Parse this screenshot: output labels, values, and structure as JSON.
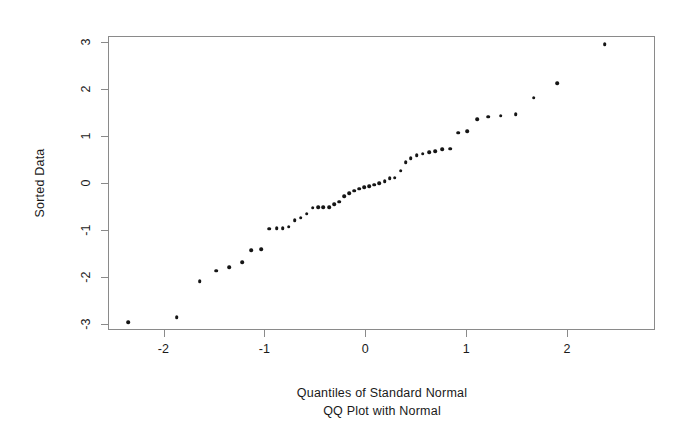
{
  "chart_data": {
    "type": "scatter",
    "title": "QQ Plot with Normal",
    "subtitle": "",
    "xlabel": "Quantiles of Standard Normal",
    "ylabel": "Sorted Data",
    "xlim": [
      -2.55,
      2.87
    ],
    "ylim": [
      -3.13,
      3.13
    ],
    "xticks": [
      -2,
      -1,
      0,
      1,
      2
    ],
    "xtick_labels": [
      "-2",
      "-1",
      "0",
      "1",
      "2"
    ],
    "yticks": [
      3,
      2,
      1,
      0,
      -1,
      -2,
      -3
    ],
    "ytick_labels": [
      "3",
      "2",
      "1",
      "0",
      "-1",
      "-2",
      "-3"
    ],
    "grid": false,
    "legend": false,
    "marker": "dot",
    "marker_color": "#151515",
    "frame_color": "#8a8a8a",
    "background": "#ffffff",
    "n_points": 50,
    "series": [
      {
        "name": "Sorted Data",
        "x": [
          -2.35,
          -1.87,
          -1.64,
          -1.48,
          -1.35,
          -1.22,
          -1.13,
          -1.03,
          -0.95,
          -0.88,
          -0.82,
          -0.76,
          -0.7,
          -0.64,
          -0.58,
          -0.52,
          -0.47,
          -0.42,
          -0.36,
          -0.31,
          -0.26,
          -0.21,
          -0.16,
          -0.11,
          -0.06,
          -0.01,
          0.04,
          0.09,
          0.14,
          0.19,
          0.24,
          0.29,
          0.35,
          0.4,
          0.45,
          0.51,
          0.57,
          0.63,
          0.69,
          0.76,
          0.84,
          0.92,
          1.01,
          1.11,
          1.22,
          1.34,
          1.49,
          1.67,
          1.9,
          2.37
        ],
        "y": [
          -2.97,
          -2.86,
          -2.09,
          -1.87,
          -1.79,
          -1.69,
          -1.43,
          -1.41,
          -0.97,
          -0.96,
          -0.96,
          -0.93,
          -0.79,
          -0.74,
          -0.65,
          -0.53,
          -0.51,
          -0.51,
          -0.51,
          -0.45,
          -0.4,
          -0.28,
          -0.22,
          -0.16,
          -0.12,
          -0.09,
          -0.07,
          -0.04,
          0.0,
          0.04,
          0.1,
          0.11,
          0.26,
          0.44,
          0.53,
          0.59,
          0.62,
          0.66,
          0.68,
          0.72,
          0.73,
          1.07,
          1.1,
          1.36,
          1.41,
          1.43,
          1.47,
          1.82,
          2.12,
          2.95
        ]
      }
    ]
  },
  "axis_titles": {
    "y": "Sorted Data",
    "x": "Quantiles of Standard Normal",
    "subtitle": "QQ Plot with Normal"
  }
}
